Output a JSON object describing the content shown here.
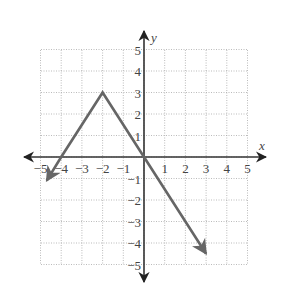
{
  "chart_data": {
    "type": "line",
    "title": "",
    "xlabel": "x",
    "ylabel": "y",
    "xlim": [
      -5,
      5
    ],
    "ylim": [
      -5,
      5
    ],
    "grid": true,
    "grid_style": "dotted",
    "x_ticks": [
      -5,
      -4,
      -3,
      -2,
      -1,
      1,
      2,
      3,
      4,
      5
    ],
    "y_ticks": [
      -5,
      -4,
      -3,
      -2,
      -1,
      1,
      2,
      3,
      4,
      5
    ],
    "x_tick_labels": [
      "−5",
      "−4",
      "−3",
      "−2",
      "−1",
      "1",
      "2",
      "3",
      "4",
      "5"
    ],
    "y_tick_labels": [
      "−5",
      "−4",
      "−3",
      "−2",
      "−1",
      "1",
      "2",
      "3",
      "4",
      "5"
    ],
    "series": [
      {
        "name": "piecewise-linear graph",
        "points": [
          [
            -4.7,
            -1.1
          ],
          [
            -4,
            0
          ],
          [
            -2,
            3
          ],
          [
            0,
            0
          ],
          [
            3,
            -4.5
          ]
        ],
        "arrows": [
          "start",
          "end"
        ],
        "vertex": [
          -2,
          3
        ],
        "color": "#666666"
      }
    ],
    "legend": null
  },
  "colors": {
    "axis": "#333333",
    "grid": "#aaaaaa",
    "line": "#666666"
  }
}
